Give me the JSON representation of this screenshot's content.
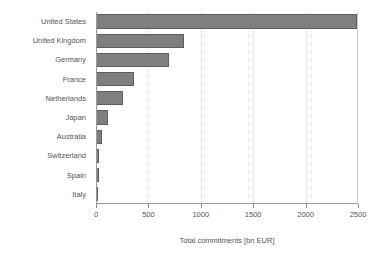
{
  "chart_data": {
    "type": "bar",
    "orientation": "horizontal",
    "title": "",
    "xlabel": "Total commitments [bn EUR]",
    "ylabel": "",
    "categories": [
      "United States",
      "United Kingdom",
      "Germany",
      "France",
      "Netherlands",
      "Japan",
      "Australia",
      "Switzerland",
      "Spain",
      "Italy"
    ],
    "values": [
      2490,
      840,
      695,
      360,
      255,
      110,
      58,
      30,
      30,
      12
    ],
    "xlim": [
      0,
      2500
    ],
    "xticks": [
      0,
      500,
      1000,
      1500,
      2000,
      2500
    ],
    "xtick_labels": [
      "0",
      "500",
      "1000",
      "1500",
      "2000",
      "2500"
    ],
    "grid": "vertical-dotted",
    "legend": "none",
    "bar_fill_color": "#7f7f7f",
    "bar_edge_color": "#5e5e5e",
    "background_color": "#ffffff",
    "axis_color": "#9a9a9a",
    "text_color": "#555555"
  }
}
